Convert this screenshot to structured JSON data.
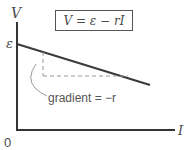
{
  "diagram": {
    "equation": "V = ε − rI",
    "y_axis_label": "V",
    "x_axis_label": "I",
    "y_intercept_label": "ε",
    "origin_label": "0",
    "gradient_annotation": "gradient = −r",
    "colors": {
      "axis": "#333333",
      "line": "#3a3a3a",
      "dashed": "#9a9a9a",
      "text": "#4a4a4a"
    }
  }
}
